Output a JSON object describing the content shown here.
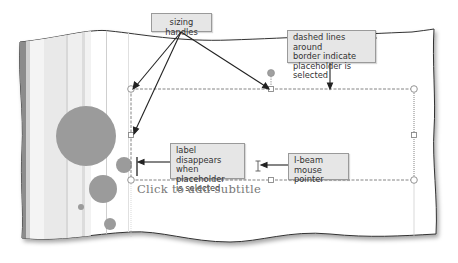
{
  "slide": {
    "subtitle_placeholder": "Click to add subtitle"
  },
  "callouts": {
    "sizing_handles": "sizing handles",
    "dashed_lines": [
      "dashed lines around",
      "border indicate",
      "placeholder is selected"
    ],
    "label_disappears": [
      "label disappears",
      "when placeholder",
      "is selected"
    ],
    "ibeam_pointer": [
      "I-beam mouse",
      "pointer"
    ]
  },
  "colors": {
    "circle_fill": "#9b9b9b",
    "callout_bg": "#e6e6e6",
    "stripe_dark": "#8c8c8c",
    "handle_stroke": "#8a8a8a"
  }
}
